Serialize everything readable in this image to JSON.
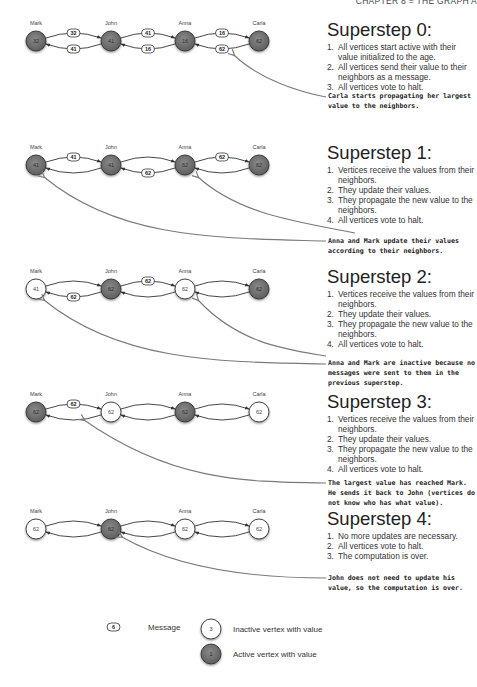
{
  "header": {
    "text": "CHAPTER 8 = THE GRAPH A"
  },
  "colors": {
    "active_vertex": "#707070",
    "inactive_vertex": "#ffffff",
    "edge": "#333333",
    "annotation_arrow": "#7a7a7a"
  },
  "vertex_names": [
    "Mark",
    "John",
    "Anna",
    "Carla"
  ],
  "supersteps": [
    {
      "title": "Superstep 0:",
      "items": [
        {
          "num": "1.",
          "text": "All vertices start active with their value initialized to the age."
        },
        {
          "num": "2.",
          "text": "All vertices send their value to their neighbors as a message."
        },
        {
          "num": "3.",
          "text": "All vertices vote to halt."
        }
      ],
      "note": "Carla starts propagating her largest value to the neighbors.",
      "vertices": [
        {
          "name": "Mark",
          "value": "32",
          "active": true
        },
        {
          "name": "John",
          "value": "41",
          "active": true
        },
        {
          "name": "Anna",
          "value": "16",
          "active": true
        },
        {
          "name": "Carla",
          "value": "62",
          "active": true
        }
      ],
      "messages": [
        {
          "from": "Mark",
          "to": "John",
          "value": "32"
        },
        {
          "from": "John",
          "to": "Mark",
          "value": "41"
        },
        {
          "from": "John",
          "to": "Anna",
          "value": "41"
        },
        {
          "from": "Anna",
          "to": "John",
          "value": "16"
        },
        {
          "from": "Anna",
          "to": "Carla",
          "value": "16"
        },
        {
          "from": "Carla",
          "to": "Anna",
          "value": "62"
        }
      ]
    },
    {
      "title": "Superstep 1:",
      "items": [
        {
          "num": "1.",
          "text": "Vertices receive the values from their neighbors."
        },
        {
          "num": "2.",
          "text": "They update their values."
        },
        {
          "num": "3.",
          "text": "They propagate the new value to the neighbors."
        },
        {
          "num": "4.",
          "text": "All vertices vote to halt."
        }
      ],
      "note": "Anna and Mark update their values according to their neighbors.",
      "vertices": [
        {
          "name": "Mark",
          "value": "41",
          "active": true
        },
        {
          "name": "John",
          "value": "41",
          "active": true
        },
        {
          "name": "Anna",
          "value": "62",
          "active": true
        },
        {
          "name": "Carla",
          "value": "62",
          "active": true
        }
      ],
      "messages": [
        {
          "from": "Mark",
          "to": "John",
          "value": "41"
        },
        {
          "from": "Anna",
          "to": "John",
          "value": "62"
        },
        {
          "from": "Anna",
          "to": "Carla",
          "value": "62"
        }
      ]
    },
    {
      "title": "Superstep 2:",
      "items": [
        {
          "num": "1.",
          "text": "Vertices receive the values from their neighbors."
        },
        {
          "num": "2.",
          "text": "They update their values."
        },
        {
          "num": "3.",
          "text": "They propagate the new value to the neighbors."
        },
        {
          "num": "4.",
          "text": "All vertices vote to halt."
        }
      ],
      "note": "Anna and Mark are inactive because no messages were sent to them in the previous superstep.",
      "vertices": [
        {
          "name": "Mark",
          "value": "41",
          "active": false
        },
        {
          "name": "John",
          "value": "62",
          "active": true
        },
        {
          "name": "Anna",
          "value": "62",
          "active": false
        },
        {
          "name": "Carla",
          "value": "62",
          "active": true
        }
      ],
      "messages": [
        {
          "from": "John",
          "to": "Mark",
          "value": "62"
        },
        {
          "from": "John",
          "to": "Anna",
          "value": "62"
        }
      ]
    },
    {
      "title": "Superstep 3:",
      "items": [
        {
          "num": "1.",
          "text": "Vertices receive the values from their neighbors."
        },
        {
          "num": "2.",
          "text": "They update their values."
        },
        {
          "num": "3.",
          "text": "They propagate the new value to the neighbors."
        },
        {
          "num": "4.",
          "text": "All vertices vote to halt."
        }
      ],
      "note": "The largest value has reached Mark. He sends it back to John (vertices do not know who has what value).",
      "vertices": [
        {
          "name": "Mark",
          "value": "62",
          "active": true
        },
        {
          "name": "John",
          "value": "62",
          "active": false
        },
        {
          "name": "Anna",
          "value": "62",
          "active": true
        },
        {
          "name": "Carla",
          "value": "62",
          "active": false
        }
      ],
      "messages": [
        {
          "from": "Mark",
          "to": "John",
          "value": "62"
        }
      ]
    },
    {
      "title": "Superstep 4:",
      "items": [
        {
          "num": "1.",
          "text": "No more updates are necessary."
        },
        {
          "num": "2.",
          "text": "All vertices vote to halt."
        },
        {
          "num": "3.",
          "text": "The computation is over."
        }
      ],
      "note": "John does not need to update his value, so the computation is over.",
      "vertices": [
        {
          "name": "Mark",
          "value": "62",
          "active": false
        },
        {
          "name": "John",
          "value": "62",
          "active": true
        },
        {
          "name": "Anna",
          "value": "62",
          "active": false
        },
        {
          "name": "Carla",
          "value": "62",
          "active": false
        }
      ],
      "messages": []
    }
  ],
  "legend": {
    "message": {
      "sample": "6",
      "label": "Message"
    },
    "inactive": {
      "sample": "3",
      "label": "Inactive vertex with value"
    },
    "active": {
      "sample": "1",
      "label": "Active vertex with value"
    }
  }
}
